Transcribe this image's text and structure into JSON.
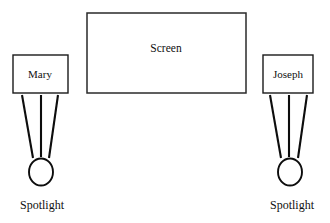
{
  "diagram": {
    "background_color": "#ffffff",
    "line_color": "#0d0d0d",
    "screen": {
      "label": "Screen",
      "x": 87,
      "y": 13,
      "width": 159,
      "height": 80,
      "text_x": 166,
      "text_y": 52
    },
    "actors": [
      {
        "name": "actor-left",
        "label": "Mary",
        "box": {
          "x": 13,
          "y": 55,
          "width": 55,
          "height": 38
        },
        "label_x": 40,
        "label_y": 78,
        "spotlight": {
          "caption": "Spotlight",
          "bulb_cx": 41,
          "bulb_cy": 172,
          "bulb_rx": 12,
          "bulb_ry": 13.5,
          "caption_x": 42,
          "caption_y": 209,
          "rays": [
            {
              "x1": 22,
              "y1": 95,
              "x2": 33,
              "y2": 158
            },
            {
              "x1": 41,
              "y1": 95,
              "x2": 41,
              "y2": 157
            },
            {
              "x1": 58,
              "y1": 95,
              "x2": 49,
              "y2": 158
            }
          ]
        }
      },
      {
        "name": "actor-right",
        "label": "Joseph",
        "box": {
          "x": 263,
          "y": 55,
          "width": 50,
          "height": 38
        },
        "label_x": 288,
        "label_y": 78,
        "spotlight": {
          "caption": "Spotlight",
          "bulb_cx": 290,
          "bulb_cy": 172,
          "bulb_rx": 12,
          "bulb_ry": 13.5,
          "caption_x": 292,
          "caption_y": 209,
          "rays": [
            {
              "x1": 270,
              "y1": 95,
              "x2": 281,
              "y2": 158
            },
            {
              "x1": 289,
              "y1": 95,
              "x2": 289,
              "y2": 157
            },
            {
              "x1": 307,
              "y1": 95,
              "x2": 298,
              "y2": 158
            }
          ]
        }
      }
    ]
  }
}
